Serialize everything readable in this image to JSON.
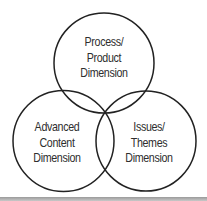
{
  "diagram": {
    "type": "venn",
    "stroke_color": "#222222",
    "text_color": "#2e2e2e",
    "circles": [
      {
        "id": "process-product",
        "lines": [
          "Process/",
          "Product",
          "Dimension"
        ],
        "cx": 104,
        "cy": 63,
        "r": 50
      },
      {
        "id": "advanced-content",
        "lines": [
          "Advanced",
          "Content",
          "Dimension"
        ],
        "cx": 63,
        "cy": 141,
        "r": 50
      },
      {
        "id": "issues-themes",
        "lines": [
          "Issues/",
          "Themes",
          "Dimension"
        ],
        "cx": 146,
        "cy": 141,
        "r": 50
      }
    ]
  }
}
